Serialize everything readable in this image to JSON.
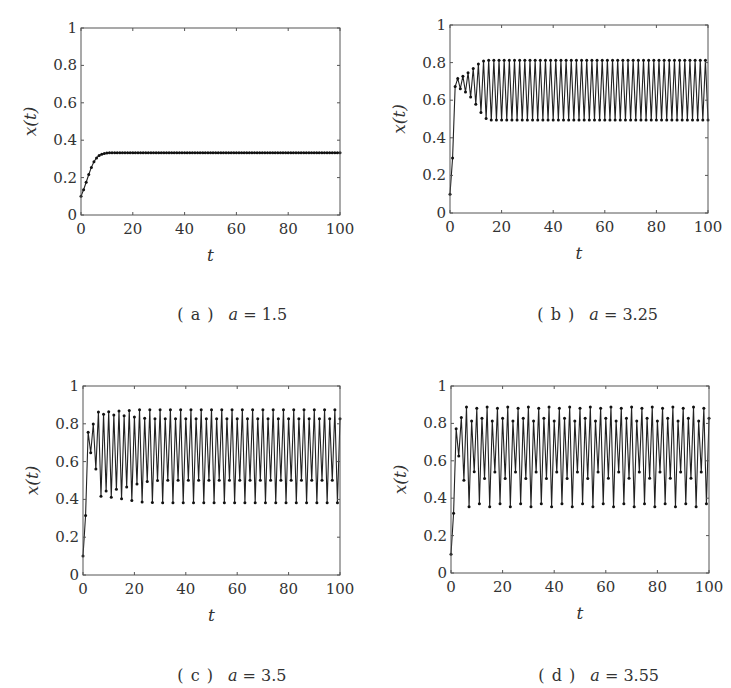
{
  "figure": {
    "model": "logistic map x(t+1) = a*x(t)*(1 - x(t))",
    "x0": 0.1,
    "t_max": 100
  },
  "panels": [
    {
      "id": "a",
      "label": "( a )",
      "param": "a",
      "value": "1.5",
      "frame": {
        "left": 81,
        "top": 28,
        "right": 340,
        "bottom": 215
      },
      "caption_pos": {
        "x": 157,
        "y": 286
      }
    },
    {
      "id": "b",
      "label": "( b )",
      "param": "a",
      "value": "3.25",
      "frame": {
        "left": 450,
        "top": 25,
        "right": 708,
        "bottom": 213
      },
      "caption_pos": {
        "x": 517,
        "y": 286
      }
    },
    {
      "id": "c",
      "label": "( c )",
      "param": "a",
      "value": "3.5",
      "frame": {
        "left": 83,
        "top": 386,
        "right": 340,
        "bottom": 575
      },
      "caption_pos": {
        "x": 157,
        "y": 647
      }
    },
    {
      "id": "d",
      "label": "( d )",
      "param": "a",
      "value": "3.55",
      "frame": {
        "left": 451,
        "top": 386,
        "right": 709,
        "bottom": 573
      },
      "caption_pos": {
        "x": 518,
        "y": 647
      }
    }
  ],
  "axes": {
    "xlabel": "t",
    "ylabel": "x(t)",
    "xticks": [
      "0",
      "20",
      "40",
      "60",
      "80",
      "100"
    ],
    "yticks": [
      "0",
      "0.2",
      "0.4",
      "0.6",
      "0.8",
      "1"
    ],
    "xlim": [
      0,
      100
    ],
    "ylim": [
      0,
      1
    ]
  },
  "style": {
    "line_color": "#222222",
    "marker_color": "#111111",
    "frame_color": "#555555"
  },
  "chart_data": [
    {
      "type": "line",
      "title": "( a )  a = 1.5",
      "xlabel": "t",
      "ylabel": "x(t)",
      "xlim": [
        0,
        100
      ],
      "ylim": [
        0,
        1
      ],
      "xticks": [
        0,
        20,
        40,
        60,
        80,
        100
      ],
      "yticks": [
        0,
        0.2,
        0.4,
        0.6,
        0.8,
        1
      ],
      "grid": false,
      "markers": true,
      "series": [
        {
          "name": "x(t), a=1.5",
          "a": 1.5,
          "x0": 0.1,
          "initial_values": [
            0.1,
            0.135,
            0.175,
            0.217,
            0.255,
            0.285,
            0.306,
            0.318,
            0.325,
            0.329
          ],
          "steady_state": [
            0.3333
          ]
        }
      ]
    },
    {
      "type": "line",
      "title": "( b )  a = 3.25",
      "xlabel": "t",
      "ylabel": "x(t)",
      "xlim": [
        0,
        100
      ],
      "ylim": [
        0,
        1
      ],
      "xticks": [
        0,
        20,
        40,
        60,
        80,
        100
      ],
      "yticks": [
        0,
        0.2,
        0.4,
        0.6,
        0.8,
        1
      ],
      "grid": false,
      "markers": true,
      "series": [
        {
          "name": "x(t), a=3.25",
          "a": 3.25,
          "x0": 0.1,
          "initial_values": [
            0.1,
            0.293,
            0.673,
            0.715,
            0.662,
            0.727,
            0.645,
            0.744,
            0.619,
            0.766
          ],
          "steady_state": [
            0.8124,
            0.4953
          ]
        }
      ]
    },
    {
      "type": "line",
      "title": "( c )  a = 3.5",
      "xlabel": "t",
      "ylabel": "x(t)",
      "xlim": [
        0,
        100
      ],
      "ylim": [
        0,
        1
      ],
      "xticks": [
        0,
        20,
        40,
        60,
        80,
        100
      ],
      "yticks": [
        0,
        0.2,
        0.4,
        0.6,
        0.8,
        1
      ],
      "grid": false,
      "markers": true,
      "series": [
        {
          "name": "x(t), a=3.5",
          "a": 3.5,
          "x0": 0.1,
          "initial_values": [
            0.1,
            0.315,
            0.755,
            0.647,
            0.799,
            0.562,
            0.862,
            0.417,
            0.851,
            0.444
          ],
          "steady_state": [
            0.875,
            0.3828,
            0.8269,
            0.5009
          ]
        }
      ]
    },
    {
      "type": "line",
      "title": "( d )  a = 3.55",
      "xlabel": "t",
      "ylabel": "x(t)",
      "xlim": [
        0,
        100
      ],
      "ylim": [
        0,
        1
      ],
      "xticks": [
        0,
        20,
        40,
        60,
        80,
        100
      ],
      "yticks": [
        0,
        0.2,
        0.4,
        0.6,
        0.8,
        1
      ],
      "grid": false,
      "markers": true,
      "series": [
        {
          "name": "x(t), a=3.55",
          "a": 3.55,
          "x0": 0.1,
          "initial_values": [
            0.1,
            0.32,
            0.772,
            0.624,
            0.833,
            0.494,
            0.887,
            0.355,
            0.813,
            0.54
          ],
          "steady_state": [
            0.8874,
            0.3548,
            0.8127,
            0.5405,
            0.8817,
            0.3703,
            0.8278,
            0.506
          ]
        }
      ]
    }
  ]
}
